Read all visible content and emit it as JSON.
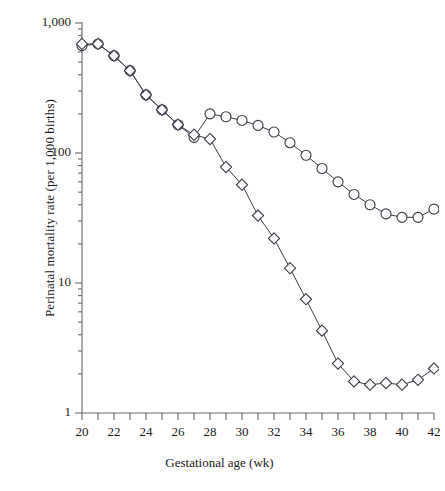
{
  "chart_data": {
    "type": "line",
    "title": "",
    "subtitle": "",
    "xlabel": "Gestational age (wk)",
    "ylabel": "Perinatal mortality rate (per 1,000 births)",
    "yscale": "log",
    "ylim": [
      1,
      1000
    ],
    "xlim": [
      20,
      42
    ],
    "grid": false,
    "legend": null,
    "y_tick_labels": [
      "1,000",
      "100",
      "10",
      "1"
    ],
    "y_tick_values": [
      1000,
      100,
      10,
      1
    ],
    "y_minor_ticks": [
      2,
      3,
      4,
      5,
      6,
      7,
      8,
      9,
      20,
      30,
      40,
      50,
      60,
      70,
      80,
      90,
      200,
      300,
      400,
      500,
      600,
      700,
      800,
      900
    ],
    "x_tick_labels": [
      "20",
      "22",
      "24",
      "26",
      "28",
      "30",
      "32",
      "34",
      "36",
      "38",
      "40",
      "42"
    ],
    "x_tick_values": [
      20,
      22,
      24,
      26,
      28,
      30,
      32,
      34,
      36,
      38,
      40,
      42
    ],
    "x_minor_ticks": [
      21,
      23,
      25,
      27,
      29,
      31,
      33,
      35,
      37,
      39,
      41
    ],
    "x": [
      20,
      21,
      22,
      23,
      24,
      25,
      26,
      27,
      28,
      29,
      30,
      31,
      32,
      33,
      34,
      35,
      36,
      37,
      38,
      39,
      40,
      41,
      42
    ],
    "series": [
      {
        "name": "circle-series",
        "marker": "circle",
        "color": "#3a3a46",
        "values": [
          670,
          690,
          560,
          430,
          280,
          215,
          165,
          132,
          200,
          190,
          178,
          163,
          145,
          120,
          96,
          76,
          60,
          48,
          40,
          34,
          32,
          32,
          37
        ]
      },
      {
        "name": "diamond-series",
        "marker": "diamond",
        "color": "#3a3a46",
        "values": [
          690,
          690,
          560,
          430,
          280,
          215,
          165,
          138,
          128,
          78,
          57,
          33,
          22,
          13,
          7.5,
          4.3,
          2.4,
          1.75,
          1.65,
          1.7,
          1.65,
          1.8,
          2.2
        ]
      }
    ]
  },
  "axes": {
    "x_axis_name": "gestational-age-axis",
    "y_axis_name": "perinatal-mortality-axis"
  }
}
